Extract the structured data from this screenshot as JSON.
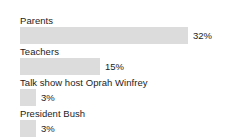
{
  "chart_data": {
    "type": "bar",
    "orientation": "horizontal",
    "title": "",
    "subtitle": "",
    "xlabel": "",
    "ylabel": "",
    "xlim": [
      0,
      32
    ],
    "grid": false,
    "legend": null,
    "value_suffix": "%",
    "categories": [
      "Parents",
      "Teachers",
      "Talk show host Oprah Winfrey",
      "President Bush"
    ],
    "values": [
      32,
      15,
      3,
      3
    ],
    "value_labels": [
      "32%",
      "15%",
      "3%",
      "3%"
    ],
    "colors": {
      "bar_fill": "#dcdcdc",
      "text": "#1c1c1c",
      "background": "#ffffff"
    }
  },
  "rows": [
    {
      "label": "Parents",
      "value_label": "32%",
      "bar_px": 168,
      "top": 15
    },
    {
      "label": "Teachers",
      "value_label": "15%",
      "bar_px": 80,
      "top": 46
    },
    {
      "label": "Talk show host Oprah Winfrey",
      "value_label": "3%",
      "bar_px": 16,
      "top": 77
    },
    {
      "label": "President Bush",
      "value_label": "3%",
      "bar_px": 16,
      "top": 108
    }
  ]
}
